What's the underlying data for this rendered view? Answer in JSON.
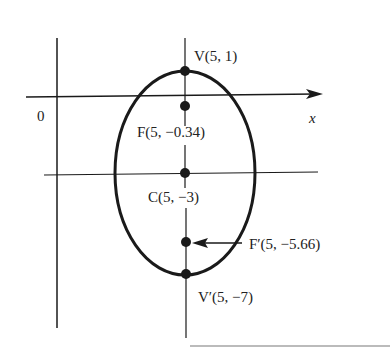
{
  "figure": {
    "type": "ellipse",
    "axis_labels": {
      "origin": "0",
      "x": "x"
    },
    "points": [
      {
        "id": "V",
        "label": "V(5, 1)",
        "name": "V",
        "coords": "(5, 1)"
      },
      {
        "id": "F",
        "label": "F(5, −0.34)",
        "name": "F",
        "coords": "(5, −0.34)"
      },
      {
        "id": "C",
        "label": "C(5, −3)",
        "name": "C",
        "coords": "(5, −3)"
      },
      {
        "id": "F2",
        "label": "F′(5, −5.66)",
        "name": "F′",
        "coords": "(5, −5.66)"
      },
      {
        "id": "V2",
        "label": "V′(5, −7)",
        "name": "V′",
        "coords": "(5, −7)"
      }
    ],
    "colors": {
      "stroke": "#1a1a1a",
      "background": "#ffffff",
      "rule": "#bbbbbb"
    }
  }
}
